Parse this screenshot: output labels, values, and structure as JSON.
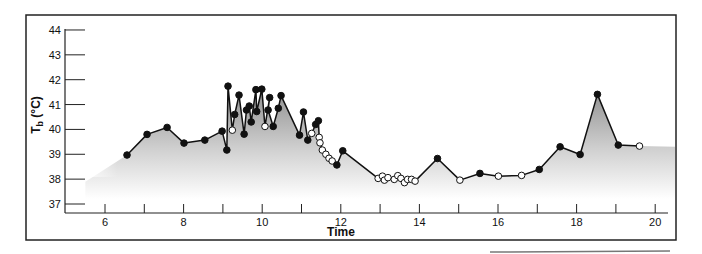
{
  "chart_data": {
    "type": "line",
    "title": "",
    "xlabel": "Time",
    "ylabel": "Tb (°C)",
    "ylabel_main": "T",
    "ylabel_sub": "b",
    "ylabel_unit": " (°C)",
    "xlim": [
      5,
      21
    ],
    "ylim": [
      37,
      44
    ],
    "xticks": [
      6,
      7,
      8,
      9,
      10,
      11,
      12,
      13,
      14,
      15,
      16,
      17,
      18,
      19,
      20
    ],
    "xtick_labels": {
      "6": "6",
      "8": "8",
      "10": "10",
      "12": "12",
      "14": "14",
      "16": "16",
      "18": "18",
      "20": "20"
    },
    "yticks": [
      37,
      38,
      39,
      40,
      41,
      42,
      43,
      44
    ],
    "grid": false,
    "legend": null,
    "fill_under_curve": "gray gradient fading to white",
    "marker_legend": {
      "filled": "filled circle",
      "open": "open circle"
    },
    "points": [
      {
        "x": 6.56,
        "y": 38.97,
        "m": "f"
      },
      {
        "x": 7.07,
        "y": 39.8,
        "m": "f"
      },
      {
        "x": 7.58,
        "y": 40.08,
        "m": "f"
      },
      {
        "x": 8.01,
        "y": 39.45,
        "m": "f"
      },
      {
        "x": 8.54,
        "y": 39.57,
        "m": "f"
      },
      {
        "x": 8.98,
        "y": 39.93,
        "m": "f"
      },
      {
        "x": 9.1,
        "y": 39.17,
        "m": "f"
      },
      {
        "x": 9.13,
        "y": 41.74,
        "m": "f"
      },
      {
        "x": 9.24,
        "y": 39.97,
        "m": "o"
      },
      {
        "x": 9.3,
        "y": 40.6,
        "m": "f"
      },
      {
        "x": 9.41,
        "y": 41.38,
        "m": "f"
      },
      {
        "x": 9.54,
        "y": 39.81,
        "m": "f"
      },
      {
        "x": 9.6,
        "y": 40.78,
        "m": "f"
      },
      {
        "x": 9.67,
        "y": 40.94,
        "m": "f"
      },
      {
        "x": 9.72,
        "y": 40.3,
        "m": "f"
      },
      {
        "x": 9.84,
        "y": 41.6,
        "m": "f"
      },
      {
        "x": 9.86,
        "y": 40.72,
        "m": "f"
      },
      {
        "x": 9.99,
        "y": 41.62,
        "m": "f"
      },
      {
        "x": 10.07,
        "y": 40.12,
        "m": "o"
      },
      {
        "x": 10.19,
        "y": 41.28,
        "m": "f"
      },
      {
        "x": 10.15,
        "y": 40.78,
        "m": "f"
      },
      {
        "x": 10.28,
        "y": 40.12,
        "m": "f"
      },
      {
        "x": 10.41,
        "y": 40.85,
        "m": "f"
      },
      {
        "x": 10.48,
        "y": 41.36,
        "m": "f"
      },
      {
        "x": 10.95,
        "y": 39.77,
        "m": "f"
      },
      {
        "x": 11.05,
        "y": 40.7,
        "m": "f"
      },
      {
        "x": 11.16,
        "y": 39.57,
        "m": "f"
      },
      {
        "x": 11.26,
        "y": 39.84,
        "m": "o"
      },
      {
        "x": 11.36,
        "y": 40.2,
        "m": "f"
      },
      {
        "x": 11.43,
        "y": 40.35,
        "m": "f"
      },
      {
        "x": 11.45,
        "y": 39.68,
        "m": "o"
      },
      {
        "x": 11.47,
        "y": 39.46,
        "m": "o"
      },
      {
        "x": 11.53,
        "y": 39.17,
        "m": "o"
      },
      {
        "x": 11.62,
        "y": 39.0,
        "m": "o"
      },
      {
        "x": 11.7,
        "y": 38.84,
        "m": "o"
      },
      {
        "x": 11.78,
        "y": 38.73,
        "m": "o"
      },
      {
        "x": 11.9,
        "y": 38.57,
        "m": "f"
      },
      {
        "x": 12.05,
        "y": 39.14,
        "m": "f"
      },
      {
        "x": 12.95,
        "y": 38.03,
        "m": "o"
      },
      {
        "x": 13.06,
        "y": 38.12,
        "m": "o"
      },
      {
        "x": 13.11,
        "y": 37.96,
        "m": "o"
      },
      {
        "x": 13.2,
        "y": 38.06,
        "m": "o"
      },
      {
        "x": 13.36,
        "y": 37.99,
        "m": "o"
      },
      {
        "x": 13.45,
        "y": 38.14,
        "m": "o"
      },
      {
        "x": 13.53,
        "y": 38.03,
        "m": "o"
      },
      {
        "x": 13.62,
        "y": 37.86,
        "m": "o"
      },
      {
        "x": 13.7,
        "y": 37.99,
        "m": "o"
      },
      {
        "x": 13.8,
        "y": 37.99,
        "m": "o"
      },
      {
        "x": 13.89,
        "y": 37.92,
        "m": "o"
      },
      {
        "x": 14.46,
        "y": 38.83,
        "m": "f"
      },
      {
        "x": 15.03,
        "y": 37.96,
        "m": "o"
      },
      {
        "x": 15.54,
        "y": 38.23,
        "m": "f"
      },
      {
        "x": 16.01,
        "y": 38.12,
        "m": "o"
      },
      {
        "x": 16.6,
        "y": 38.15,
        "m": "o"
      },
      {
        "x": 17.05,
        "y": 38.39,
        "m": "f"
      },
      {
        "x": 17.58,
        "y": 39.3,
        "m": "f"
      },
      {
        "x": 18.09,
        "y": 38.99,
        "m": "f"
      },
      {
        "x": 18.53,
        "y": 41.41,
        "m": "f"
      },
      {
        "x": 19.06,
        "y": 39.37,
        "m": "f"
      },
      {
        "x": 19.6,
        "y": 39.33,
        "m": "o"
      }
    ],
    "colors": {
      "line": "#111111",
      "marker_fill": "#111111",
      "open_marker_fill": "#ffffff",
      "area_top": "#8c8c8c",
      "area_bottom": "#ffffff",
      "frame": "#222222"
    }
  }
}
